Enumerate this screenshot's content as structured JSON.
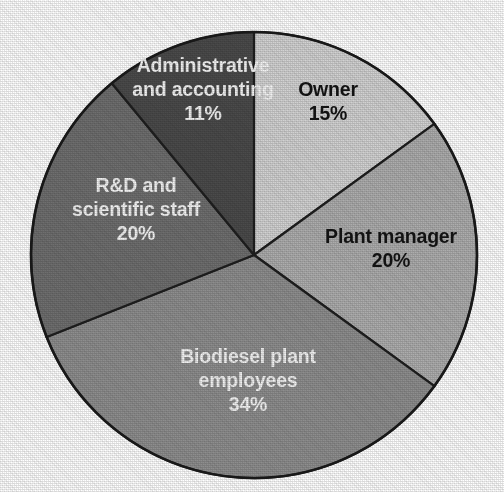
{
  "chart_data": {
    "type": "pie",
    "title": "",
    "subtitle": "",
    "xlabel": "",
    "ylabel": "",
    "legend_position": "none",
    "grid": false,
    "labels_inside_slices": true,
    "start_angle_deg": 0,
    "direction": "clockwise",
    "units": "percent",
    "total": 100,
    "categories": [
      "Owner",
      "Plant manager",
      "Biodiesel plant employees",
      "R&D and scientific staff",
      "Administrative and accounting"
    ],
    "values": [
      15,
      20,
      34,
      20,
      11
    ],
    "slices": [
      {
        "id": "owner",
        "name": "Owner",
        "label_lines": [
          "Owner",
          "15%"
        ],
        "value": 15,
        "value_text": "15%",
        "color": "#d2d2d2",
        "label_color": "#141414",
        "label_x": 328,
        "label_y": 96
      },
      {
        "id": "plant-manager",
        "name": "Plant manager",
        "label_lines": [
          "Plant manager",
          "20%"
        ],
        "value": 20,
        "value_text": "20%",
        "color": "#adadad",
        "label_color": "#141414",
        "label_x": 391,
        "label_y": 243
      },
      {
        "id": "biodiesel-plant-employees",
        "name": "Biodiesel plant employees",
        "label_lines": [
          "Biodiesel plant",
          "employees",
          "34%"
        ],
        "value": 34,
        "value_text": "34%",
        "color": "#8e8e8e",
        "label_color": "#f4f4f4",
        "label_x": 248,
        "label_y": 363
      },
      {
        "id": "rd-and-scientific-staff",
        "name": "R&D and scientific staff",
        "label_lines": [
          "R&D and",
          "scientific staff",
          "20%"
        ],
        "value": 20,
        "value_text": "20%",
        "color": "#6f6f6f",
        "label_color": "#f4f4f4",
        "label_x": 136,
        "label_y": 192
      },
      {
        "id": "administrative-and-accounting",
        "name": "Administrative and accounting",
        "label_lines": [
          "Administrative",
          "and accounting",
          "11%"
        ],
        "value": 11,
        "value_text": "11%",
        "color": "#4b4b4b",
        "label_color": "#f4f4f4",
        "label_x": 203,
        "label_y": 72
      }
    ],
    "geometry": {
      "center_x": 254,
      "center_y": 255,
      "radius": 223,
      "canvas_width": 504,
      "canvas_height": 492
    },
    "style": {
      "background": "#ffffff",
      "slice_border": "#1f1f1f",
      "outline": "#1a1a1a"
    }
  }
}
